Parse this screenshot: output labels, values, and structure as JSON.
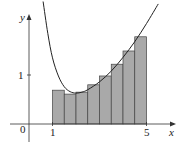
{
  "chart_data": {
    "type": "bar",
    "title": "",
    "xlabel": "x",
    "ylabel": "y",
    "x_ticks": [
      "0",
      "1",
      "5"
    ],
    "y_ticks": [
      "1"
    ],
    "xlim": [
      0,
      5.8
    ],
    "ylim": [
      0,
      2.3
    ],
    "grid": false,
    "bar_edges": [
      1,
      1.5,
      2,
      2.5,
      3,
      3.5,
      4,
      4.5,
      5
    ],
    "categories": [
      "1–1.5",
      "1.5–2",
      "2–2.5",
      "2.5–3",
      "3–3.5",
      "3.5–4",
      "4–4.5",
      "4.5–5"
    ],
    "values": [
      0.69,
      0.61,
      0.65,
      0.8,
      0.98,
      1.22,
      1.49,
      1.78
    ],
    "curve": {
      "name": "y = f(x)",
      "x": [
        0.6,
        0.8,
        1.0,
        1.25,
        1.5,
        1.75,
        2.0,
        2.25,
        2.5,
        3.0,
        3.5,
        4.0,
        4.5,
        5.0,
        5.5
      ],
      "y": [
        2.5,
        1.85,
        1.35,
        0.98,
        0.76,
        0.66,
        0.63,
        0.65,
        0.7,
        0.86,
        1.08,
        1.36,
        1.68,
        2.05,
        2.45
      ]
    },
    "bar_color": "#a9a9a9",
    "curve_color": "#222222"
  },
  "labels": {
    "origin": "0",
    "x_tick_1": "1",
    "x_tick_5": "5",
    "y_tick_1": "1",
    "x_axis": "x",
    "y_axis": "y"
  }
}
